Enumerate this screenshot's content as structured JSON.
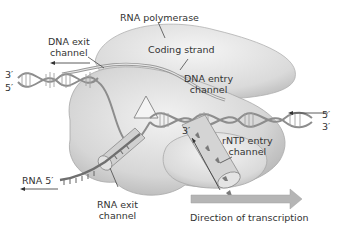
{
  "labels": {
    "rna_polymerase": "RNA polymerase",
    "coding_strand": "Coding strand",
    "dna_exit_channel_line1": "DNA exit",
    "dna_exit_channel_line2": "channel",
    "dna_entry_channel_line1": "DNA entry",
    "dna_entry_channel_line2": "channel",
    "rntp_entry_channel_line1": "rNTP entry",
    "rntp_entry_channel_line2": "channel",
    "rna_exit_channel_line1": "RNA exit",
    "rna_exit_channel_line2": "channel",
    "rna_5prime": "RNA 5′",
    "direction_of_transcription": "Direction of transcription"
  },
  "strand_ends": {
    "left_top": "3′",
    "left_bottom": "5′",
    "right_top": "5′",
    "right_bottom": "3′",
    "rna_3prime": "3′"
  },
  "colors": {
    "enzyme_fill": "#dcdcdc",
    "enzyme_shadow": "#b5b5b5",
    "dna_strand": "#9a9a9a",
    "transcription_arrow": "#b0b0b0",
    "text": "#333333"
  }
}
